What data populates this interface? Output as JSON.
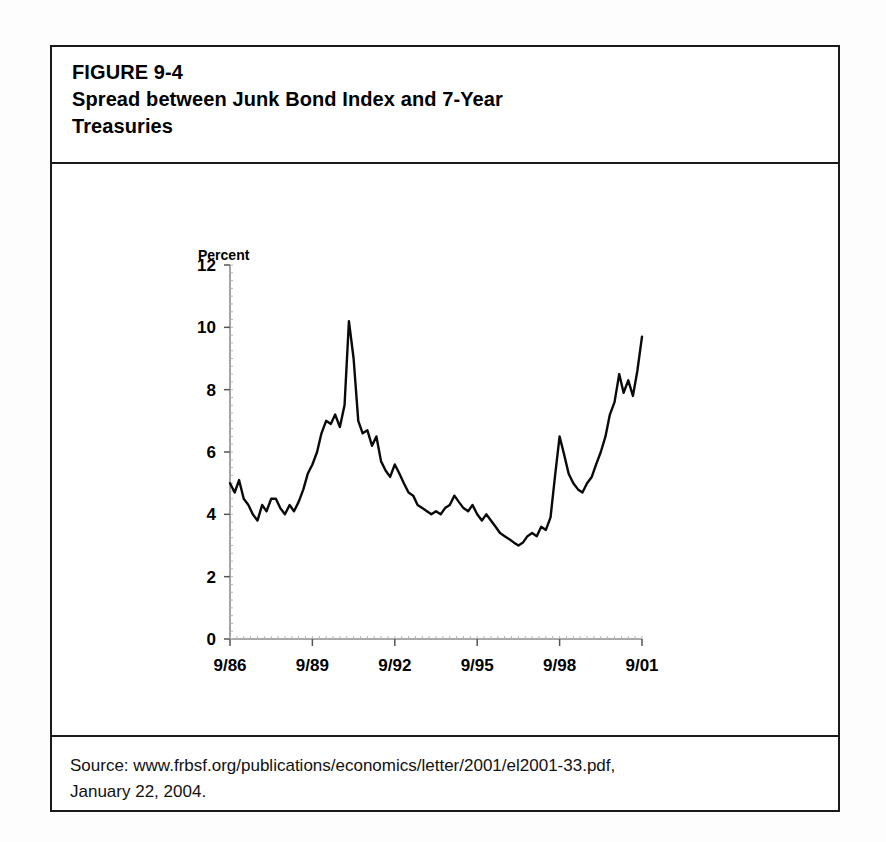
{
  "figure": {
    "label": "FIGURE 9-4",
    "title_line1": "Spread between Junk Bond Index and 7-Year",
    "title_line2": "Treasuries",
    "source_line1": "Source: www.frbsf.org/publications/economics/letter/2001/el2001-33.pdf,",
    "source_line2": "January 22, 2004."
  },
  "chart_data": {
    "type": "line",
    "title": "Spread between Junk Bond Index and 7-Year Treasuries",
    "xlabel": "",
    "ylabel": "Percent",
    "ylim": [
      0,
      12
    ],
    "yticks": [
      0,
      2,
      4,
      6,
      8,
      10,
      12
    ],
    "ytick_labels": [
      "0",
      "2",
      "4",
      "6",
      "8",
      "10",
      "12"
    ],
    "xtick_labels": [
      "9/86",
      "9/89",
      "9/92",
      "9/95",
      "9/98",
      "9/01"
    ],
    "xtick_values": [
      1986.75,
      1989.75,
      1992.75,
      1995.75,
      1998.75,
      2001.75
    ],
    "xlim": [
      1986.75,
      2001.75
    ],
    "grid": false,
    "legend": null,
    "series": [
      {
        "name": "Junk bond spread over 7-year Treasuries",
        "color": "#0a0a0a",
        "x": [
          1986.75,
          1986.92,
          1987.08,
          1987.25,
          1987.42,
          1987.58,
          1987.75,
          1987.92,
          1988.08,
          1988.25,
          1988.42,
          1988.58,
          1988.75,
          1988.92,
          1989.08,
          1989.25,
          1989.42,
          1989.58,
          1989.75,
          1989.92,
          1990.08,
          1990.25,
          1990.42,
          1990.58,
          1990.75,
          1990.92,
          1991.08,
          1991.25,
          1991.42,
          1991.58,
          1991.75,
          1991.92,
          1992.08,
          1992.25,
          1992.42,
          1992.58,
          1992.75,
          1992.92,
          1993.08,
          1993.25,
          1993.42,
          1993.58,
          1993.75,
          1993.92,
          1994.08,
          1994.25,
          1994.42,
          1994.58,
          1994.75,
          1994.92,
          1995.08,
          1995.25,
          1995.42,
          1995.58,
          1995.75,
          1995.92,
          1996.08,
          1996.25,
          1996.42,
          1996.58,
          1996.75,
          1996.92,
          1997.08,
          1997.25,
          1997.42,
          1997.58,
          1997.75,
          1997.92,
          1998.08,
          1998.25,
          1998.42,
          1998.58,
          1998.75,
          1998.92,
          1999.08,
          1999.25,
          1999.42,
          1999.58,
          1999.75,
          1999.92,
          2000.08,
          2000.25,
          2000.42,
          2000.58,
          2000.75,
          2000.92,
          2001.08,
          2001.25,
          2001.42,
          2001.58,
          2001.75
        ],
        "y": [
          5.0,
          4.7,
          5.1,
          4.5,
          4.3,
          4.0,
          3.8,
          4.3,
          4.1,
          4.5,
          4.5,
          4.2,
          4.0,
          4.3,
          4.1,
          4.4,
          4.8,
          5.3,
          5.6,
          6.0,
          6.6,
          7.0,
          6.9,
          7.2,
          6.8,
          7.5,
          10.2,
          9.0,
          7.0,
          6.6,
          6.7,
          6.2,
          6.5,
          5.7,
          5.4,
          5.2,
          5.6,
          5.3,
          5.0,
          4.7,
          4.6,
          4.3,
          4.2,
          4.1,
          4.0,
          4.1,
          4.0,
          4.2,
          4.3,
          4.6,
          4.4,
          4.2,
          4.1,
          4.3,
          4.0,
          3.8,
          4.0,
          3.8,
          3.6,
          3.4,
          3.3,
          3.2,
          3.1,
          3.0,
          3.1,
          3.3,
          3.4,
          3.3,
          3.6,
          3.5,
          3.9,
          5.2,
          6.5,
          5.9,
          5.3,
          5.0,
          4.8,
          4.7,
          5.0,
          5.2,
          5.6,
          6.0,
          6.5,
          7.2,
          7.6,
          8.5,
          7.9,
          8.3,
          7.8,
          8.6,
          9.7
        ]
      }
    ],
    "notes": {
      "peak_value": 10.2,
      "peak_date": "1991.08",
      "trough_value": 3.0,
      "trough_date": "1997.25",
      "end_value": 9.7
    }
  },
  "axis": {
    "unit_label": "Percent"
  }
}
